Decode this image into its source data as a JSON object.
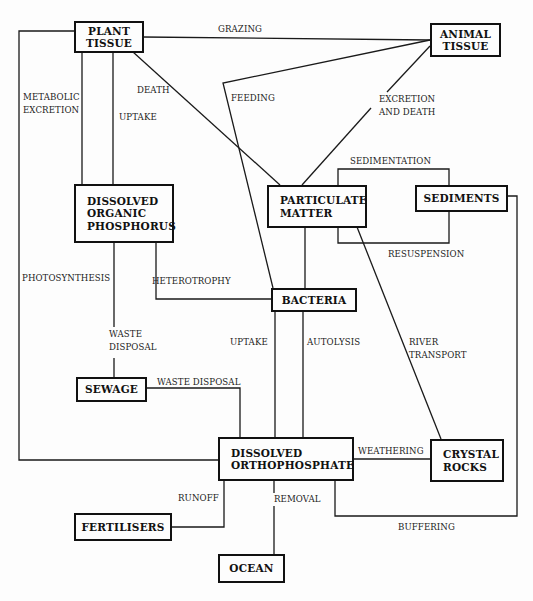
{
  "diagram": {
    "nodes": {
      "plant_tissue": {
        "lines": [
          "PLANT",
          "TISSUE"
        ]
      },
      "animal_tissue": {
        "lines": [
          "ANIMAL",
          "TISSUE"
        ]
      },
      "dissolved_organic_phosphorus": {
        "lines": [
          "DISSOLVED",
          "ORGANIC",
          "PHOSPHORUS"
        ]
      },
      "particulate_matter": {
        "lines": [
          "PARTICULATE",
          "MATTER"
        ]
      },
      "sediments": {
        "lines": [
          "SEDIMENTS"
        ]
      },
      "bacteria": {
        "lines": [
          "BACTERIA"
        ]
      },
      "sewage": {
        "lines": [
          "SEWAGE"
        ]
      },
      "dissolved_orthophosphate": {
        "lines": [
          "DISSOLVED",
          "ORTHOPHOSPHATE"
        ]
      },
      "crystal_rocks": {
        "lines": [
          "CRYSTAL",
          "ROCKS"
        ]
      },
      "fertilisers": {
        "lines": [
          "FERTILISERS"
        ]
      },
      "ocean": {
        "lines": [
          "OCEAN"
        ]
      }
    },
    "edge_labels": {
      "grazing": [
        "GRAZING"
      ],
      "metabolic_excretion": [
        "METABOLIC",
        "EXCRETION"
      ],
      "death": [
        "DEATH"
      ],
      "uptake_plant": [
        "UPTAKE"
      ],
      "feeding": [
        "FEEDING"
      ],
      "excretion_and_death": [
        "EXCRETION",
        "AND DEATH"
      ],
      "sedimentation": [
        "SEDIMENTATION"
      ],
      "resuspension": [
        "RESUSPENSION"
      ],
      "photosynthesis": [
        "PHOTOSYNTHESIS"
      ],
      "heterotrophy": [
        "HETEROTROPHY"
      ],
      "waste_disposal_vertical": [
        "WASTE",
        "DISPOSAL"
      ],
      "uptake_bacteria": [
        "UPTAKE"
      ],
      "autolysis": [
        "AUTOLYSIS"
      ],
      "river_transport": [
        "RIVER",
        "TRANSPORT"
      ],
      "waste_disposal_horizontal": [
        "WASTE DISPOSAL"
      ],
      "weathering": [
        "WEATHERING"
      ],
      "runoff": [
        "RUNOFF"
      ],
      "removal": [
        "REMOVAL"
      ],
      "buffering": [
        "BUFFERING"
      ]
    }
  }
}
